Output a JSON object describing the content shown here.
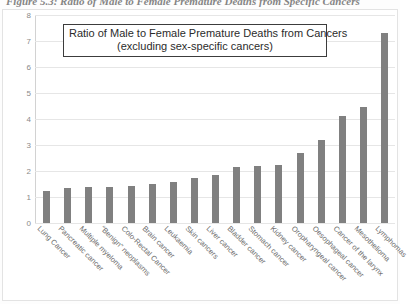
{
  "figure_caption": "Figure 5.3: Ratio of Male to Female Premature Deaths from Specific Cancers",
  "chart_data": {
    "type": "bar",
    "title": "Ratio of Male to Female Premature Deaths from Cancers",
    "subtitle": "(excluding sex-specific cancers)",
    "title_lines": [
      "Ratio of Male to Female Premature Deaths from Cancers",
      "(excluding sex-specific cancers)"
    ],
    "xlabel": "",
    "ylabel": "",
    "ylim": [
      0,
      8
    ],
    "yticks": [
      "0",
      "1",
      "2",
      "3",
      "4",
      "5",
      "6",
      "7",
      "8"
    ],
    "ytick_values": [
      0,
      1,
      2,
      3,
      4,
      5,
      6,
      7,
      8
    ],
    "grid": true,
    "legend": "none",
    "bar_color": "#808080",
    "categories": [
      "Lung Cancer",
      "Pancreatic cancer",
      "Multiple myeloma",
      "“Benign” neoplasms",
      "Colo-Rectal Cancer",
      "Brain cancer",
      "Leukaemia",
      "Skin cancers",
      "Liver cancer",
      "Bladder cancer",
      "Stomach cancer",
      "Kidney cancer",
      "Oropharyngeal cancer",
      "Oesophageal cancer",
      "Cancer of the larynx",
      "Mesothelioma",
      "Lymphomas"
    ],
    "values": [
      1.22,
      1.33,
      1.37,
      1.4,
      1.43,
      1.49,
      1.58,
      1.74,
      1.86,
      2.15,
      2.18,
      2.22,
      2.68,
      3.19,
      4.1,
      4.45,
      7.3
    ]
  }
}
